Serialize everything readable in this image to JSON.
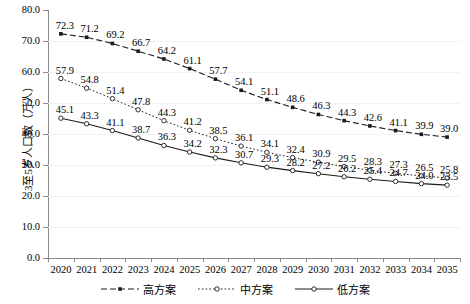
{
  "chart_data": {
    "type": "line",
    "title": "",
    "xlabel": "",
    "ylabel": "3至5岁人口数（万人）",
    "ylim": [
      0.0,
      80.0
    ],
    "ytick_step": 10.0,
    "ytick_labels": [
      "80.0",
      "70.0",
      "60.0",
      "50.0",
      "40.0",
      "30.0",
      "20.0",
      "10.0",
      "0.0"
    ],
    "grid": true,
    "legend_position": "bottom",
    "categories": [
      "2020",
      "2021",
      "2022",
      "2023",
      "2024",
      "2025",
      "2026",
      "2027",
      "2028",
      "2029",
      "2030",
      "2031",
      "2032",
      "2033",
      "2034",
      "2035"
    ],
    "series": [
      {
        "name": "高方案",
        "marker": "filled-square",
        "line_style": "dashed",
        "color": "#1a1a1a",
        "values": [
          72.3,
          71.2,
          69.2,
          66.7,
          64.2,
          61.1,
          57.7,
          54.1,
          51.1,
          48.6,
          46.3,
          44.3,
          42.6,
          41.1,
          39.9,
          39.0
        ]
      },
      {
        "name": "中方案",
        "marker": "open-circle",
        "line_style": "dotted",
        "color": "#1a1a1a",
        "values": [
          57.9,
          54.8,
          51.4,
          47.8,
          44.3,
          41.2,
          38.5,
          36.1,
          34.1,
          32.4,
          30.9,
          29.5,
          28.3,
          27.3,
          26.5,
          25.8
        ]
      },
      {
        "name": "低方案",
        "marker": "open-circle",
        "line_style": "solid",
        "color": "#1a1a1a",
        "values": [
          45.1,
          43.3,
          41.1,
          38.7,
          36.3,
          34.2,
          32.3,
          30.7,
          29.3,
          28.2,
          27.2,
          26.2,
          25.4,
          24.7,
          24.0,
          23.5
        ]
      }
    ]
  },
  "legend": {
    "items": [
      {
        "label": "高方案"
      },
      {
        "label": "中方案"
      },
      {
        "label": "低方案"
      }
    ]
  }
}
